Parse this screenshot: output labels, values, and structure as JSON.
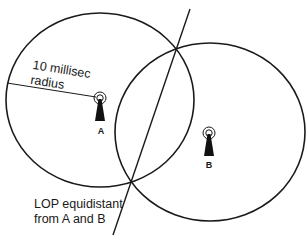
{
  "diagram": {
    "colors": {
      "stroke": "#1a1a1a",
      "background": "#ffffff"
    },
    "circles": [
      {
        "id": "A",
        "cx": 100,
        "cy": 100,
        "rx": 94,
        "ry": 87
      },
      {
        "id": "B",
        "cx": 210,
        "cy": 132,
        "rx": 95,
        "ry": 89
      }
    ],
    "lop_line": {
      "x1": 190,
      "y1": 9,
      "x2": 113,
      "y2": 235
    },
    "radius_line": {
      "x1": 7,
      "y1": 83,
      "x2": 98,
      "y2": 97
    },
    "intersections": [
      {
        "x": 176,
        "y": 48
      },
      {
        "x": 131,
        "y": 180
      }
    ],
    "stations": [
      {
        "id": "A",
        "label": "A",
        "icon": "radio-tower-icon",
        "x": 100,
        "y": 98
      },
      {
        "id": "B",
        "label": "B",
        "icon": "radio-tower-icon",
        "x": 209,
        "y": 133
      }
    ],
    "labels": {
      "radius_line1": "10 millisec",
      "radius_line2": "radius",
      "lop_line1": "LOP equidistant",
      "lop_line2": "from A and B",
      "station_a": "A",
      "station_b": "B"
    }
  }
}
